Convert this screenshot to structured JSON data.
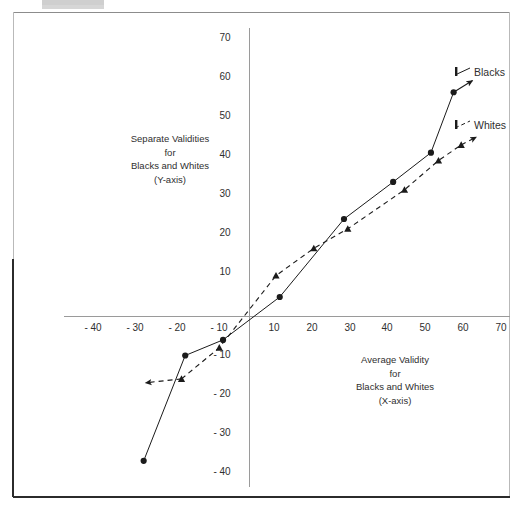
{
  "chart_data": {
    "type": "line",
    "title": "",
    "xlabel": "Average Validity\nfor\nBlacks and Whites\n(X-axis)",
    "ylabel": "Separate Validities\nfor\nBlacks and Whites\n(Y-axis)",
    "xlim": [
      -45,
      72
    ],
    "ylim": [
      -42,
      72
    ],
    "grid": false,
    "legend_position": "right-inside",
    "xticks": [
      "- 40",
      "- 30",
      "- 20",
      "- 10",
      "10",
      "20",
      "30",
      "40",
      "50",
      "60",
      "70"
    ],
    "xtick_values": [
      -40,
      -30,
      -20,
      -10,
      10,
      20,
      30,
      40,
      50,
      60,
      70
    ],
    "yticks": [
      "70",
      "60",
      "50",
      "40",
      "30",
      "20",
      "10",
      "- 10",
      "- 20",
      "- 30",
      "- 40"
    ],
    "ytick_values": [
      70,
      60,
      50,
      40,
      30,
      20,
      10,
      -10,
      -20,
      -30,
      -40
    ],
    "series": [
      {
        "name": "Blacks",
        "style": "solid",
        "marker": "circle",
        "color": "#1b1b1b",
        "arrow_end": true,
        "points": [
          {
            "x": -28,
            "y": -37
          },
          {
            "x": -17,
            "y": -10
          },
          {
            "x": -7,
            "y": -6
          },
          {
            "x": 8,
            "y": 5
          },
          {
            "x": 25,
            "y": 25
          },
          {
            "x": 38,
            "y": 34.5
          },
          {
            "x": 48,
            "y": 42
          },
          {
            "x": 54,
            "y": 57.5
          }
        ],
        "arrow_tip": {
          "x": 59,
          "y": 60.5
        }
      },
      {
        "name": "Whites",
        "style": "dashed",
        "marker": "triangle",
        "color": "#1b1b1b",
        "arrow_start": true,
        "arrow_end": true,
        "arrow_tip_start": {
          "x": -27.5,
          "y": -17
        },
        "points": [
          {
            "x": -18,
            "y": -16
          },
          {
            "x": -8,
            "y": -8
          },
          {
            "x": 7,
            "y": 10.5
          },
          {
            "x": 17,
            "y": 17.5
          },
          {
            "x": 26,
            "y": 22.5
          },
          {
            "x": 41,
            "y": 32.5
          },
          {
            "x": 50,
            "y": 40
          },
          {
            "x": 56,
            "y": 44
          }
        ],
        "arrow_tip": {
          "x": 60,
          "y": 46
        }
      }
    ],
    "legend": [
      {
        "label": "Blacks",
        "style": "solid",
        "marker": "circle"
      },
      {
        "label": "Whites",
        "style": "dashed",
        "marker": "triangle"
      }
    ]
  },
  "axis_titles": {
    "y_axis": "Separate Validities\nfor\nBlacks and Whites\n(Y-axis)",
    "x_axis": "Average Validity\nfor\nBlacks and Whites\n(X-axis)"
  },
  "legend": {
    "blacks": "Blacks",
    "whites": "Whites"
  },
  "x_ticks": {
    "t0": "- 40",
    "t1": "- 30",
    "t2": "- 20",
    "t3": "- 10",
    "t4": "10",
    "t5": "20",
    "t6": "30",
    "t7": "40",
    "t8": "50",
    "t9": "60",
    "t10": "70"
  },
  "y_ticks": {
    "t0": "70",
    "t1": "60",
    "t2": "50",
    "t3": "40",
    "t4": "30",
    "t5": "20",
    "t6": "10",
    "t7": "- 10",
    "t8": "- 20",
    "t9": "- 30",
    "t10": "- 40"
  },
  "colors": {
    "ink": "#1b1b1b",
    "axis": "#9a9a9a",
    "frame_light": "#b9b9b9",
    "frame_dark": "#2b2b2b",
    "background": "#ffffff"
  }
}
